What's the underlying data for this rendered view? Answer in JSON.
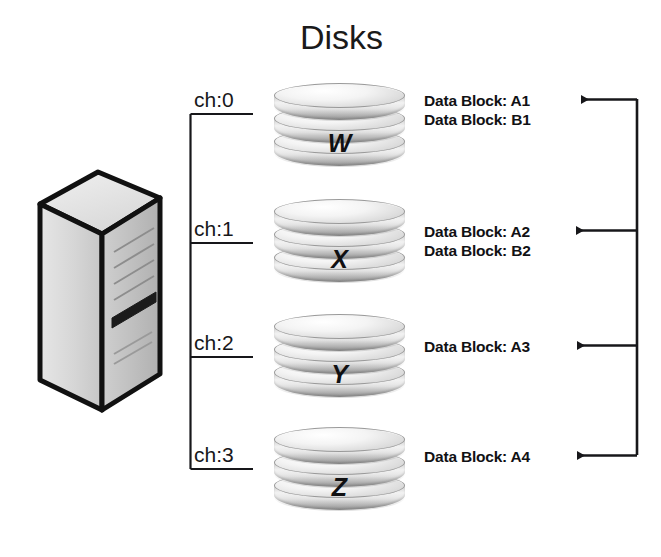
{
  "diagram": {
    "title": "Disks",
    "server": {
      "label": "server-tower"
    },
    "channels": [
      {
        "id": "ch0",
        "label": "ch:0"
      },
      {
        "id": "ch1",
        "label": "ch:1"
      },
      {
        "id": "ch2",
        "label": "ch:2"
      },
      {
        "id": "ch3",
        "label": "ch:3"
      }
    ],
    "disks": [
      {
        "id": "disk-w",
        "letter": "W"
      },
      {
        "id": "disk-x",
        "letter": "X"
      },
      {
        "id": "disk-y",
        "letter": "Y"
      },
      {
        "id": "disk-z",
        "letter": "Z"
      }
    ],
    "data_blocks": [
      {
        "primary": "Data Block: A1",
        "secondary": "Data Block: B1",
        "has_arrow": true
      },
      {
        "primary": "Data Block: A2",
        "secondary": "Data Block: B2",
        "has_arrow": true
      },
      {
        "primary": "Data Block: A3",
        "secondary": "",
        "has_arrow": true
      },
      {
        "primary": "Data Block: A4",
        "secondary": "",
        "has_arrow": true
      }
    ],
    "colors": {
      "line": "#17171a",
      "text": "#111114",
      "background": "#ffffff",
      "disk_light": "#f2f2f2",
      "disk_dark": "#a9a9a9",
      "tower_outline": "#111111",
      "tower_left_face": "#d2d2d2",
      "tower_front_face": "#bdbdbd"
    }
  }
}
